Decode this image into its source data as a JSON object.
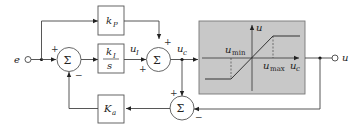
{
  "diagram": {
    "input": {
      "label": "e"
    },
    "output": {
      "label": "u"
    },
    "blocks": {
      "proportional": {
        "label": "k",
        "sub": "P"
      },
      "integral": {
        "num": "k",
        "num_sub": "I",
        "den": "s"
      },
      "antiwindup": {
        "label": "K",
        "sub": "a"
      },
      "saturation": {
        "y_axis": "u",
        "x_axis": "u",
        "x_axis_sub": "c",
        "min_label": "u",
        "min_sub": "min",
        "max_label": "u",
        "max_sub": "max",
        "fill": "#c8c8c8"
      }
    },
    "summing_junctions": {
      "sum1": {
        "symbol": "Σ",
        "signs": [
          "+",
          "−"
        ]
      },
      "sum2": {
        "symbol": "Σ",
        "signs": [
          "+",
          "+"
        ]
      },
      "sum3": {
        "symbol": "Σ",
        "signs": [
          "+",
          "−"
        ]
      }
    },
    "signals": {
      "uI": {
        "label": "u",
        "sub": "I"
      },
      "uc": {
        "label": "u",
        "sub": "c"
      }
    }
  }
}
